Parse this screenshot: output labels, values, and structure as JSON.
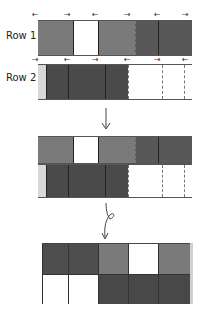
{
  "labels": {
    "row1": "Row 1",
    "row2": "Row 2"
  },
  "colors": {
    "gray": "#7a7a7a",
    "dark": "#4a4a4a",
    "darker": "#555555",
    "white": "#ffffff",
    "light": "#d8d8d8"
  },
  "row1": {
    "segments": [
      {
        "w": 35,
        "color": "#7a7a7a",
        "edge": "solid"
      },
      {
        "w": 25,
        "color": "#ffffff",
        "edge": "solid"
      },
      {
        "w": 37,
        "color": "#7a7a7a",
        "edge": "solid"
      },
      {
        "w": 23,
        "color": "#585858",
        "edge": "dash"
      },
      {
        "w": 34,
        "color": "#585858",
        "edge": "solid"
      }
    ],
    "arrows": [
      "left",
      "right",
      "left",
      "right",
      "left",
      "right"
    ]
  },
  "row2": {
    "segments": [
      {
        "w": 8,
        "color": "#d8d8d8",
        "edge": "dash"
      },
      {
        "w": 22,
        "color": "#4a4a4a",
        "edge": "solid"
      },
      {
        "w": 37,
        "color": "#4a4a4a",
        "edge": "solid"
      },
      {
        "w": 23,
        "color": "#4a4a4a",
        "edge": "solid"
      },
      {
        "w": 34,
        "color": "#ffffff",
        "edge": "dash"
      },
      {
        "w": 22,
        "color": "#ffffff",
        "edge": "dash"
      },
      {
        "w": 8,
        "color": "#ffffff",
        "edge": "dash"
      }
    ],
    "arrows": [
      "right",
      "left",
      "right",
      "left",
      "right",
      "left"
    ]
  },
  "steps": [
    {
      "type": "straight-arrow",
      "label": "down"
    },
    {
      "type": "loop-arrow",
      "label": "down-loop"
    }
  ],
  "final_grid": {
    "columns": 5,
    "rows": [
      [
        "#4e4e4e",
        "#4e4e4e",
        "#7a7a7a",
        "#ffffff",
        "#7a7a7a"
      ],
      [
        "#ffffff",
        "#ffffff",
        "#484848",
        "#484848",
        "#484848"
      ]
    ]
  }
}
